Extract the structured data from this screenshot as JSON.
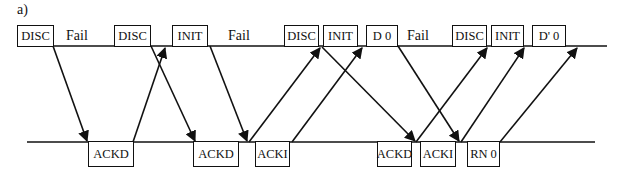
{
  "figure": {
    "panel_label": "a)",
    "top_line": {
      "x1": 17,
      "x2": 607,
      "y": 46
    },
    "bottom_line": {
      "x1": 27,
      "x2": 595,
      "y": 142
    },
    "top_boxes": [
      {
        "label": "DISC",
        "x": 17,
        "w": 37
      },
      {
        "label": "DISC",
        "x": 114,
        "w": 37
      },
      {
        "label": "INIT",
        "x": 172,
        "w": 36
      },
      {
        "label": "DISC",
        "x": 284,
        "w": 35
      },
      {
        "label": "INIT",
        "x": 323,
        "w": 35
      },
      {
        "label": "D 0",
        "x": 366,
        "w": 32
      },
      {
        "label": "DISC",
        "x": 452,
        "w": 35
      },
      {
        "label": "INIT",
        "x": 491,
        "w": 33
      },
      {
        "label": "D' 0",
        "x": 532,
        "w": 34
      }
    ],
    "fail_labels": [
      {
        "label": "Fail",
        "x": 66
      },
      {
        "label": "Fail",
        "x": 228
      },
      {
        "label": "Fail",
        "x": 407
      }
    ],
    "bottom_boxes": [
      {
        "label": "ACKD",
        "x": 88,
        "w": 46
      },
      {
        "label": "ACKD",
        "x": 193,
        "w": 46
      },
      {
        "label": "ACKI",
        "x": 255,
        "w": 35
      },
      {
        "label": "ACKD",
        "x": 377,
        "w": 35
      },
      {
        "label": "ACKI",
        "x": 420,
        "w": 36
      },
      {
        "label": "RN 0",
        "x": 467,
        "w": 33
      }
    ],
    "arrows": [
      {
        "from": [
          53,
          46
        ],
        "to": [
          87,
          141
        ]
      },
      {
        "from": [
          133,
          142
        ],
        "to": [
          165,
          48
        ]
      },
      {
        "from": [
          151,
          46
        ],
        "to": [
          195,
          141
        ]
      },
      {
        "from": [
          210,
          46
        ],
        "to": [
          247,
          141
        ]
      },
      {
        "from": [
          249,
          142
        ],
        "to": [
          320,
          48
        ]
      },
      {
        "from": [
          292,
          142
        ],
        "to": [
          362,
          48
        ]
      },
      {
        "from": [
          322,
          47
        ],
        "to": [
          415,
          141
        ]
      },
      {
        "from": [
          398,
          46
        ],
        "to": [
          459,
          141
        ]
      },
      {
        "from": [
          416,
          142
        ],
        "to": [
          487,
          48
        ]
      },
      {
        "from": [
          461,
          142
        ],
        "to": [
          524,
          48
        ]
      },
      {
        "from": [
          500,
          142
        ],
        "to": [
          577,
          48
        ]
      }
    ]
  }
}
